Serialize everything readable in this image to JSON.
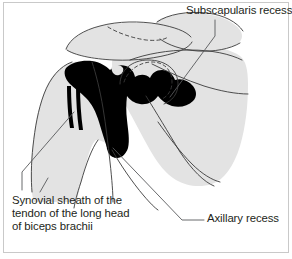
{
  "figure": {
    "type": "anatomical-line-drawing",
    "width": 292,
    "height": 259,
    "background_color": "#ffffff",
    "frame_color": "#c9c9c9"
  },
  "colors": {
    "bone_silhouette": "#e3e3e3",
    "joint_cavity": "#000000",
    "outline": "#3b3b3b",
    "leader_line": "#58595b",
    "text": "#231f20"
  },
  "labels": {
    "subscapularis": {
      "text": "Subscapularis recess",
      "lines": [
        "Subscapularis recess"
      ]
    },
    "synovial_sheath": {
      "text": "Synovial sheath of the tendon of the long head of biceps brachii",
      "lines": [
        "Synovial sheath of the",
        "tendon of the long head",
        "of biceps brachii"
      ]
    },
    "axillary": {
      "text": "Axillary recess",
      "lines": [
        "Axillary recess"
      ]
    }
  },
  "structures": {
    "acromion": "acromion-outline",
    "clavicle": "clavicle-outline",
    "humeral_head": "humeral-head-outline",
    "scapula": "scapula-silhouette",
    "glenoid_dashed": "glenoid-dashed-outline",
    "joint_cavity": "joint-cavity-fill",
    "biceps_tendon_sheath": "biceps-tendon-sheath-bands"
  }
}
